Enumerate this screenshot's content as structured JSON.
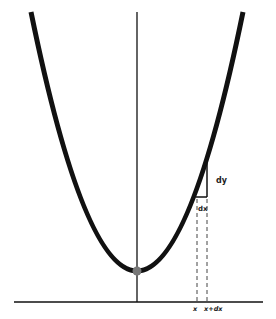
{
  "diagram": {
    "labels": {
      "dy": "dy",
      "dx": "dx",
      "x": "x",
      "x_plus_dx": "x+dx"
    },
    "colors": {
      "curve": "#111111",
      "axis": "#111111",
      "vertex_point": "#777777",
      "dashed": "#444444"
    }
  }
}
